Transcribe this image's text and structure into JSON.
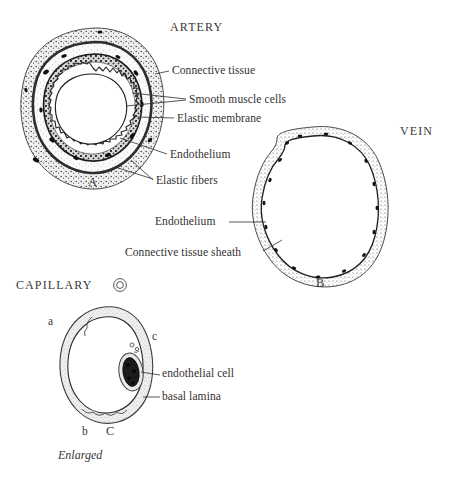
{
  "figure": {
    "background": "#ffffff",
    "ink": "#333030"
  },
  "headings": {
    "artery": "ARTERY",
    "vein": "VEIN",
    "capillary": "CAPILLARY"
  },
  "panel_letters": {
    "a": "A",
    "b": "B",
    "c": "C"
  },
  "artery": {
    "lumen_label": "Lumen",
    "callouts": [
      {
        "text": "Connective tissue"
      },
      {
        "text": "Smooth muscle cells"
      },
      {
        "text": "Elastic membrane"
      },
      {
        "text": "Endothelium"
      },
      {
        "text": "Elastic fibers"
      }
    ]
  },
  "vein": {
    "callouts": [
      {
        "text": "Endothelium"
      },
      {
        "text": "Connective tissue sheath"
      }
    ]
  },
  "capillary": {
    "callouts": [
      {
        "text": "endothelial cell"
      },
      {
        "text": "basal lamina"
      }
    ],
    "markers": [
      {
        "text": "a"
      },
      {
        "text": "b"
      },
      {
        "text": "c"
      }
    ],
    "scale_note": "Enlarged"
  }
}
